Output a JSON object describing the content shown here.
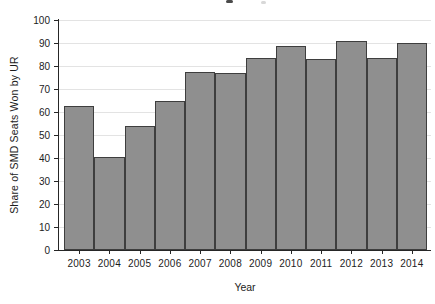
{
  "chart_data": {
    "type": "bar",
    "title": "",
    "categories": [
      "2003",
      "2004",
      "2005",
      "2006",
      "2007",
      "2008",
      "2009",
      "2010",
      "2011",
      "2012",
      "2013",
      "2014"
    ],
    "values": [
      62.5,
      40.5,
      54,
      65,
      77.5,
      77,
      83.5,
      88.5,
      83,
      91,
      83.5,
      90
    ],
    "xlabel": "Year",
    "ylabel": "Share of SMD Seats Won by UR",
    "ylim": [
      0,
      100
    ],
    "yticks": [
      0,
      10,
      20,
      30,
      40,
      50,
      60,
      70,
      80,
      90,
      100
    ],
    "grid": true,
    "legend": "none",
    "colors": {
      "bar_fill": "#8f8f8f",
      "bar_border": "#3e3e3e",
      "gridline": "#e3e3e3",
      "axis": "#262626",
      "text": "#1c1c1c",
      "background": "#ffffff"
    }
  }
}
